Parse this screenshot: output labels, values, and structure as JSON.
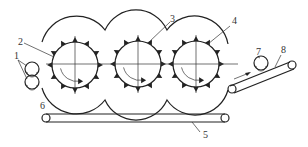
{
  "diagram": {
    "type": "mechanical schematic",
    "colors": {
      "line": "#222222",
      "background": "#ffffff"
    },
    "labels": [
      {
        "id": "1",
        "text": "1",
        "x": 14,
        "y": 59
      },
      {
        "id": "2",
        "text": "2",
        "x": 18,
        "y": 45
      },
      {
        "id": "3",
        "text": "3",
        "x": 170,
        "y": 22
      },
      {
        "id": "4",
        "text": "4",
        "x": 232,
        "y": 24
      },
      {
        "id": "5",
        "text": "5",
        "x": 203,
        "y": 138
      },
      {
        "id": "6",
        "text": "6",
        "x": 40,
        "y": 109
      },
      {
        "id": "7",
        "text": "7",
        "x": 256,
        "y": 55
      },
      {
        "id": "8",
        "text": "8",
        "x": 281,
        "y": 53
      }
    ],
    "drums": [
      {
        "name": "drum-1",
        "cx": 75,
        "cy": 65,
        "r": 23
      },
      {
        "name": "drum-2",
        "cx": 138,
        "cy": 64,
        "r": 23
      },
      {
        "name": "drum-3",
        "cx": 196,
        "cy": 64,
        "r": 23
      }
    ],
    "feed_rollers": [
      {
        "name": "feed-roller-top",
        "cx": 32,
        "cy": 69,
        "r": 7
      },
      {
        "name": "feed-roller-bottom",
        "cx": 32,
        "cy": 82,
        "r": 7
      }
    ],
    "bottom_conveyor": {
      "x1": 46,
      "x2": 225,
      "y": 118,
      "r": 4
    },
    "exit_conveyor": {
      "x1": 232,
      "y1": 89,
      "x2": 292,
      "y2": 65,
      "r": 4
    },
    "exit_roller": {
      "cx": 261,
      "cy": 63,
      "r": 7
    }
  }
}
